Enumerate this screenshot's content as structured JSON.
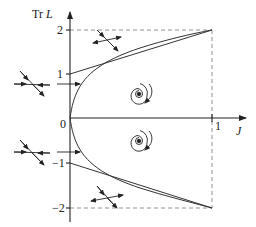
{
  "figure": {
    "y_axis_label_prefix": "Tr",
    "y_axis_label_var": "L",
    "x_axis_label": "J",
    "y_ticks": [
      {
        "label": "2",
        "value": 2
      },
      {
        "label": "1",
        "value": 1
      },
      {
        "label": "0",
        "value": 0
      },
      {
        "label": "−1",
        "value": -1
      },
      {
        "label": "−2",
        "value": -2
      }
    ],
    "x_ticks": [
      {
        "label": "1",
        "value": 1
      }
    ],
    "curves": [
      {
        "name": "parabola",
        "description": "Tr L = ±2√J boundary from origin to (1, ±2)"
      },
      {
        "name": "upper-line",
        "description": "line from (0,1) to (1,2)"
      },
      {
        "name": "lower-line",
        "description": "line from (0,-1) to (1,-2)"
      }
    ],
    "dashed_box": {
      "x_max": 1,
      "y_min": -2,
      "y_max": 2
    },
    "icons": [
      "saddle-icon-upper-left",
      "saddle-icon-upper-top",
      "saddle-icon-lower-left",
      "saddle-icon-lower-bottom",
      "spiral-icon-upper",
      "spiral-icon-lower",
      "arrow-icon-upper",
      "arrow-icon-lower"
    ]
  }
}
